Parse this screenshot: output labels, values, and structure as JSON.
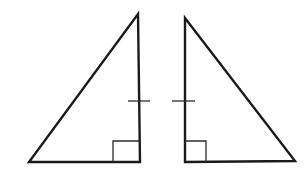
{
  "figure": {
    "background": "#ffffff",
    "stroke_color": "#1a1a1a",
    "triangles": [
      {
        "name": "left-triangle",
        "vertices": [
          [
            29,
            162
          ],
          [
            140,
            162
          ],
          [
            138,
            14
          ]
        ],
        "right_angle_box": {
          "x": 113,
          "y": 141,
          "w": 27,
          "h": 21
        },
        "tick": {
          "x1": 128,
          "y1": 101,
          "x2": 150,
          "y2": 101
        }
      },
      {
        "name": "right-triangle",
        "vertices": [
          [
            185,
            162
          ],
          [
            295,
            161
          ],
          [
            185,
            18
          ]
        ],
        "right_angle_box": {
          "x": 185,
          "y": 141,
          "w": 21,
          "h": 21
        },
        "tick": {
          "x1": 172,
          "y1": 101,
          "x2": 195,
          "y2": 101
        }
      }
    ]
  }
}
